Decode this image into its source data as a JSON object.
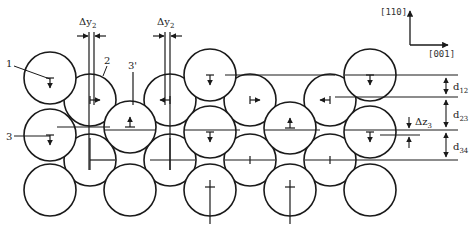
{
  "figure": {
    "line_color": "#1a1a1a",
    "background": "#ffffff"
  },
  "axes": {
    "vertical": "[110]",
    "horizontal": "[001]"
  },
  "labels": {
    "atom_1": "1",
    "atom_2": "2",
    "atom_3": "3",
    "atom_3prime": "3'"
  },
  "dimensions": {
    "dy2_left": {
      "base": "Δy",
      "sub": "2"
    },
    "dy2_right": {
      "base": "Δy",
      "sub": "2"
    },
    "dz3": {
      "base": "Δz",
      "sub": "3"
    },
    "d12": {
      "base": "d",
      "sub": "12"
    },
    "d23": {
      "base": "d",
      "sub": "23"
    },
    "d34": {
      "base": "d",
      "sub": "34"
    }
  },
  "atoms": [
    {
      "layer": 1,
      "x": 50,
      "y": 78,
      "mark": "down"
    },
    {
      "layer": 1,
      "x": 210,
      "y": 75,
      "mark": "down"
    },
    {
      "layer": 1,
      "x": 370,
      "y": 75,
      "mark": "down"
    },
    {
      "layer": 2,
      "x": 90,
      "y": 100,
      "mark": "right"
    },
    {
      "layer": 2,
      "x": 170,
      "y": 100,
      "mark": "left"
    },
    {
      "layer": 2,
      "x": 250,
      "y": 100,
      "mark": "right"
    },
    {
      "layer": 2,
      "x": 330,
      "y": 100,
      "mark": "left"
    },
    {
      "layer": 3,
      "x": 50,
      "y": 135,
      "mark": "down"
    },
    {
      "layer": 3,
      "x": 130,
      "y": 127,
      "mark": "up"
    },
    {
      "layer": 3,
      "x": 210,
      "y": 132,
      "mark": "down"
    },
    {
      "layer": 3,
      "x": 290,
      "y": 128,
      "mark": "up"
    },
    {
      "layer": 3,
      "x": 370,
      "y": 132,
      "mark": "down"
    },
    {
      "layer": 4,
      "x": 90,
      "y": 160,
      "mark": "cross"
    },
    {
      "layer": 4,
      "x": 170,
      "y": 160,
      "mark": "cross"
    },
    {
      "layer": 4,
      "x": 250,
      "y": 160,
      "mark": "tick"
    },
    {
      "layer": 4,
      "x": 330,
      "y": 160,
      "mark": "tick"
    },
    {
      "layer": 5,
      "x": 50,
      "y": 190,
      "mark": "none"
    },
    {
      "layer": 5,
      "x": 130,
      "y": 190,
      "mark": "none"
    },
    {
      "layer": 5,
      "x": 210,
      "y": 190,
      "mark": "cross-long"
    },
    {
      "layer": 5,
      "x": 290,
      "y": 190,
      "mark": "cross-long"
    },
    {
      "layer": 5,
      "x": 370,
      "y": 190,
      "mark": "none"
    }
  ]
}
